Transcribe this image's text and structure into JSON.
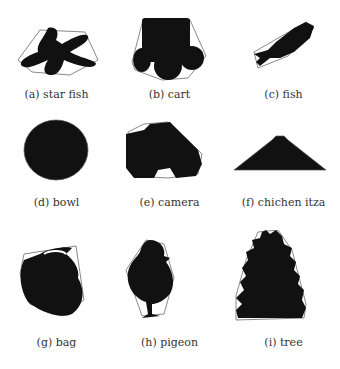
{
  "figures": [
    {
      "label": "(a) star fish"
    },
    {
      "label": "(b) cart"
    },
    {
      "label": "(c) fish"
    },
    {
      "label": "(d) bowl"
    },
    {
      "label": "(e) camera"
    },
    {
      "label": "(f) chichen itza"
    },
    {
      "label": "(g) bag"
    },
    {
      "label": "(h) pigeon"
    },
    {
      "label": "(i) tree"
    }
  ],
  "colors": {
    "shape": "#111111",
    "hull": "#555555",
    "text": "#333333"
  }
}
